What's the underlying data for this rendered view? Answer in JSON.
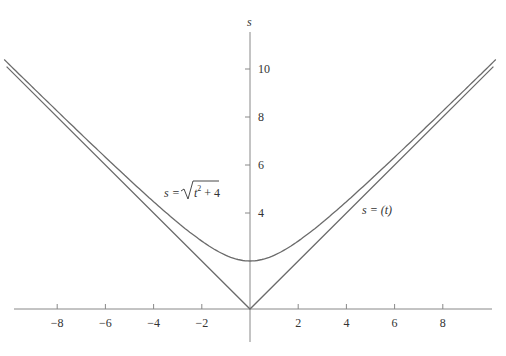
{
  "chart_data": {
    "type": "line",
    "title": "",
    "xlabel": "",
    "ylabel": "s",
    "xlim": [
      -10,
      10
    ],
    "ylim": [
      0,
      12
    ],
    "grid": false,
    "x_ticks": [
      -8,
      -6,
      -4,
      -2,
      2,
      4,
      6,
      8
    ],
    "x_tick_labels": [
      "−8",
      "−6",
      "−4",
      "−2",
      "2",
      "4",
      "6",
      "8"
    ],
    "y_ticks": [
      4,
      6,
      8,
      10
    ],
    "y_tick_labels": [
      "4",
      "6",
      "8",
      "10"
    ],
    "series": [
      {
        "name": "s = √(t² + 4)",
        "formula": "sqrt(t^2+4)",
        "x": [
          -10,
          -8,
          -6,
          -4,
          -2,
          0,
          2,
          4,
          6,
          8,
          10
        ],
        "values": [
          10.2,
          8.25,
          6.32,
          4.47,
          2.83,
          2.0,
          2.83,
          4.47,
          6.32,
          8.25,
          10.2
        ]
      },
      {
        "name": "s = |t|",
        "formula": "abs(t)",
        "x": [
          -10,
          -8,
          -6,
          -4,
          -2,
          0,
          2,
          4,
          6,
          8,
          10
        ],
        "values": [
          10,
          8,
          6,
          4,
          2,
          0,
          2,
          4,
          6,
          8,
          10
        ]
      }
    ],
    "annotations": [
      {
        "text_prefix": "s = ",
        "text": "s = √(t² + 4)",
        "near": "left curve"
      },
      {
        "text": "s = (t)",
        "near": "right lines"
      }
    ]
  },
  "labels": {
    "y_axis": "s",
    "curve_label_prefix": "s = ",
    "curve_label_radicand_t": "t",
    "curve_label_exp": "2",
    "curve_label_rest": " + 4",
    "line_label": "s = (t)"
  }
}
